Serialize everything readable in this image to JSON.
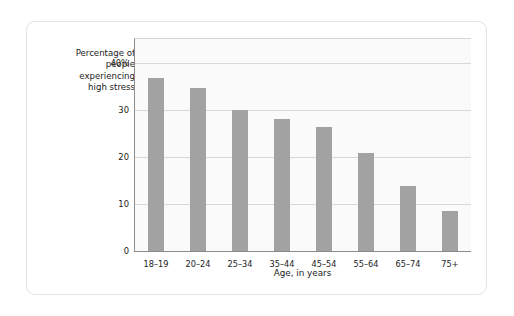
{
  "chart_data": {
    "type": "bar",
    "title": "",
    "subtitle": "",
    "xlabel": "Age, in years",
    "ylabel": "Percentage of\npeople\nexperiencing\nhigh stress",
    "categories": [
      "18–19",
      "20–24",
      "25–34",
      "35–44",
      "45–54",
      "55–64",
      "65–74",
      "75+"
    ],
    "values": [
      36.8,
      34.6,
      30.0,
      28.0,
      26.4,
      20.7,
      13.8,
      8.4
    ],
    "ylim": [
      0,
      45
    ],
    "yticks": [
      0,
      10,
      20,
      30,
      40
    ],
    "ytick_labels": [
      "0",
      "10",
      "20",
      "30",
      "40%"
    ],
    "grid": "horizontal",
    "legend": "none",
    "bar_color": "#a2a2a2",
    "plot_background": "#fafafa",
    "gridline_color": "#d8d8d8",
    "axis_color": "#8c8c8c"
  }
}
